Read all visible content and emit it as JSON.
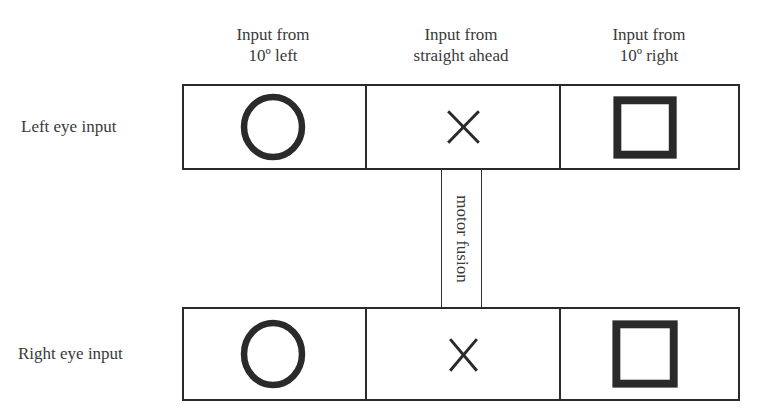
{
  "columns": [
    {
      "line1": "Input from",
      "line2": "10º left"
    },
    {
      "line1": "Input from",
      "line2": "straight ahead"
    },
    {
      "line1": "Input from",
      "line2": "10º right"
    }
  ],
  "rows": [
    {
      "label": "Left eye input",
      "cells": [
        "circle",
        "cross",
        "square"
      ]
    },
    {
      "label": "Right eye input",
      "cells": [
        "circle",
        "cross",
        "square"
      ]
    }
  ],
  "connector": {
    "label": "motor fusion"
  },
  "colors": {
    "stroke": "#2a2a2a",
    "background": "#ffffff"
  }
}
